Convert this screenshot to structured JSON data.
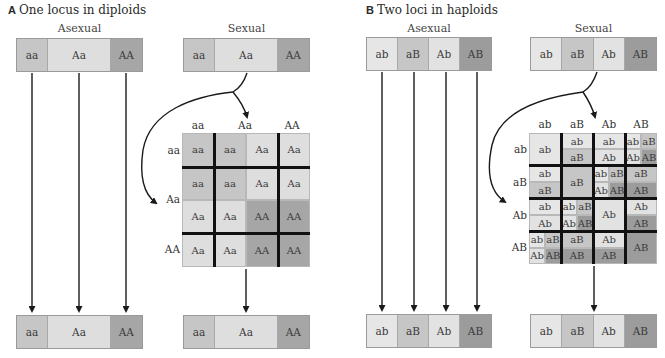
{
  "colors": {
    "aa": "#c6c6c6",
    "Aa": "#dedede",
    "AA": "#a6a6a6",
    "ab": "#e6e6e6",
    "aB": "#c6c6c6",
    "Ab": "#e2e2e2",
    "AB": "#9c9c9c",
    "arrow": "#1a1a1a",
    "divider": "#111111"
  },
  "panelA": {
    "letter": "A",
    "title": "One locus in diploids",
    "asexual_label": "Asexual",
    "sexual_label": "Sexual",
    "genotypes": [
      "aa",
      "Aa",
      "AA"
    ],
    "bar_fractions": [
      0.25,
      0.5,
      0.25
    ],
    "grid": {
      "col_headers": [
        "aa",
        "Aa",
        "AA"
      ],
      "row_headers": [
        "aa",
        "Aa",
        "AA"
      ],
      "cells": [
        [
          "aa",
          "aa",
          "Aa",
          "Aa"
        ],
        [
          "aa",
          "aa",
          "Aa",
          "Aa"
        ],
        [
          "Aa",
          "Aa",
          "AA",
          "AA"
        ],
        [
          "Aa",
          "Aa",
          "AA",
          "AA"
        ]
      ]
    }
  },
  "panelB": {
    "letter": "B",
    "title": "Two loci in haploids",
    "asexual_label": "Asexual",
    "sexual_label": "Sexual",
    "genotypes": [
      "ab",
      "aB",
      "Ab",
      "AB"
    ],
    "grid": {
      "col_headers": [
        "ab",
        "aB",
        "Ab",
        "AB"
      ],
      "row_headers": [
        "ab",
        "aB",
        "Ab",
        "AB"
      ],
      "cells": [
        [
          {
            "type": "full",
            "v": [
              "ab"
            ]
          },
          {
            "type": "half",
            "v": [
              "ab",
              "aB"
            ]
          },
          {
            "type": "half",
            "v": [
              "ab",
              "Ab"
            ]
          },
          {
            "type": "quad",
            "v": [
              "ab",
              "aB",
              "Ab",
              "AB"
            ]
          }
        ],
        [
          {
            "type": "half",
            "v": [
              "ab",
              "aB"
            ]
          },
          {
            "type": "full",
            "v": [
              "aB"
            ]
          },
          {
            "type": "quad",
            "v": [
              "ab",
              "aB",
              "Ab",
              "AB"
            ]
          },
          {
            "type": "half",
            "v": [
              "aB",
              "AB"
            ]
          }
        ],
        [
          {
            "type": "half",
            "v": [
              "ab",
              "Ab"
            ]
          },
          {
            "type": "quad",
            "v": [
              "ab",
              "aB",
              "Ab",
              "AB"
            ]
          },
          {
            "type": "full",
            "v": [
              "Ab"
            ]
          },
          {
            "type": "half",
            "v": [
              "Ab",
              "AB"
            ]
          }
        ],
        [
          {
            "type": "quad",
            "v": [
              "ab",
              "aB",
              "Ab",
              "AB"
            ]
          },
          {
            "type": "half",
            "v": [
              "aB",
              "AB"
            ]
          },
          {
            "type": "half",
            "v": [
              "Ab",
              "AB"
            ]
          },
          {
            "type": "full",
            "v": [
              "AB"
            ]
          }
        ]
      ]
    }
  }
}
